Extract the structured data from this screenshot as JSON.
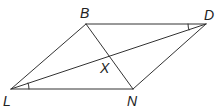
{
  "figure": {
    "type": "parallelogram-with-diagonals",
    "stroke_color": "#333333",
    "vertices": {
      "B": {
        "label": "B",
        "x": 86,
        "y": 24
      },
      "D": {
        "label": "D",
        "x": 206,
        "y": 24
      },
      "L": {
        "label": "L",
        "x": 11,
        "y": 89
      },
      "N": {
        "label": "N",
        "x": 133,
        "y": 89
      }
    },
    "intersection": {
      "label": "X",
      "x": 110,
      "y": 57
    },
    "segments": [
      "BD",
      "DN",
      "NL",
      "LB",
      "BN",
      "LD"
    ],
    "angle_marks": [
      {
        "at": "D",
        "between": [
          "B",
          "L"
        ]
      },
      {
        "at": "L",
        "between": [
          "N",
          "D"
        ]
      }
    ]
  },
  "labels": {
    "B": "B",
    "D": "D",
    "L": "L",
    "N": "N",
    "X": "X"
  }
}
